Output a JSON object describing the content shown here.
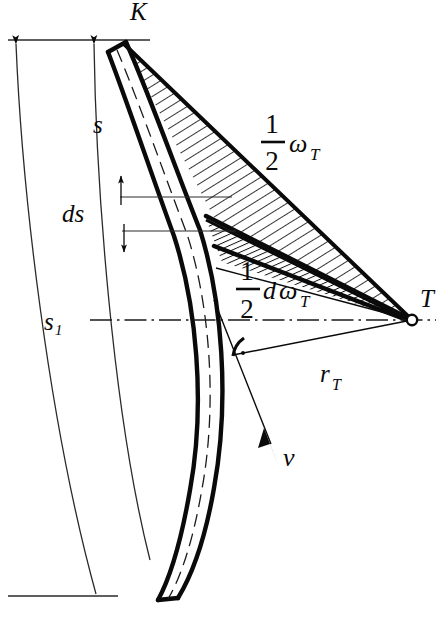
{
  "figure": {
    "type": "technical-diagram",
    "title": "",
    "description_labels": {
      "blade_tip": "K",
      "center_point": "T",
      "arc_outer": "s",
      "arc_inner": "s₁",
      "arc_increment": "ds",
      "angle_half_omega_num": "1",
      "angle_half_omega_den": "2",
      "angle_half_omega_sym": "ω",
      "angle_half_omega_sub": "T",
      "angle_half_domega_num": "1",
      "angle_half_domega_den": "2",
      "angle_half_domega_d": "d",
      "angle_half_domega_sym": "ω",
      "angle_half_domega_sub": "T",
      "radius_sym": "r",
      "radius_sub": "T",
      "velocity": "v"
    },
    "colors": {
      "ink": "#0a0a0a",
      "paper": "#ffffff",
      "hatch": "#111111",
      "thin_line": "#2a2a2a"
    },
    "geometry": {
      "center_T": [
        412,
        320
      ],
      "blade_tip_K": [
        118,
        36
      ],
      "blade_bottom": [
        118,
        600
      ],
      "centerline_y": 320,
      "top_rule_y": 40,
      "bottom_rule_y": 596
    }
  }
}
